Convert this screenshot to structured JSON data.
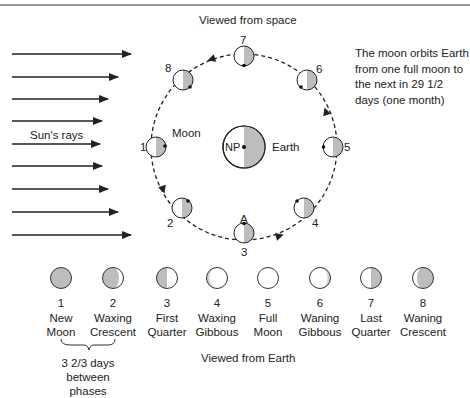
{
  "title_space": "Viewed from space",
  "title_earth": "Viewed from Earth",
  "note": "The moon orbits Earth from one full moon to the next in 29 1/2 days (one month)",
  "sun_label": "Sun's rays",
  "earth": {
    "label": "Earth",
    "pole_label": "NP"
  },
  "moon_label": "Moon",
  "point_label": "A",
  "interval": {
    "line1": "3 2/3 days",
    "line2": "between phases"
  },
  "orbit_positions": [
    {
      "n": "1"
    },
    {
      "n": "2"
    },
    {
      "n": "3"
    },
    {
      "n": "4"
    },
    {
      "n": "5"
    },
    {
      "n": "6"
    },
    {
      "n": "7"
    },
    {
      "n": "8"
    }
  ],
  "phases": [
    {
      "n": "1",
      "line1": "New",
      "line2": "Moon"
    },
    {
      "n": "2",
      "line1": "Waxing",
      "line2": "Crescent"
    },
    {
      "n": "3",
      "line1": "First",
      "line2": "Quarter"
    },
    {
      "n": "4",
      "line1": "Waxing",
      "line2": "Gibbous"
    },
    {
      "n": "5",
      "line1": "Full",
      "line2": "Moon"
    },
    {
      "n": "6",
      "line1": "Waning",
      "line2": "Gibbous"
    },
    {
      "n": "7",
      "line1": "Last",
      "line2": "Quarter"
    },
    {
      "n": "8",
      "line1": "Waning",
      "line2": "Crescent"
    }
  ],
  "colors": {
    "shade": "#bdbdbd",
    "line": "#222222"
  }
}
